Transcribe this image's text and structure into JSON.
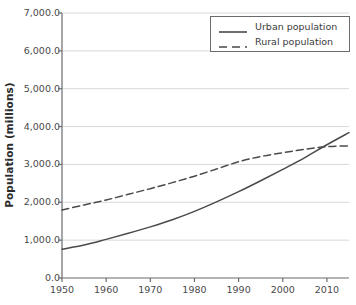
{
  "chart_data": {
    "type": "line",
    "title": "",
    "xlabel": "",
    "ylabel": "Population (millions)",
    "xlim": [
      1950,
      2015
    ],
    "ylim": [
      0,
      7000
    ],
    "grid": true,
    "legend_position": "top-right",
    "x_ticks": [
      1950,
      1960,
      1970,
      1980,
      1990,
      2000,
      2010
    ],
    "x_tick_labels": [
      "1950",
      "1960",
      "1970",
      "1980",
      "1990",
      "2000",
      "2010"
    ],
    "y_ticks": [
      0,
      1000,
      2000,
      3000,
      4000,
      5000,
      6000,
      7000
    ],
    "y_tick_labels": [
      "0.0",
      "1,000.0",
      "2,000.0",
      "3,000.0",
      "4,000.0",
      "5,000.0",
      "6,000.0",
      "7,000.0"
    ],
    "x": [
      1950,
      1955,
      1960,
      1965,
      1970,
      1975,
      1980,
      1985,
      1990,
      1995,
      2000,
      2005,
      2010,
      2015
    ],
    "series": [
      {
        "name": "Urban population",
        "style": "solid",
        "color": "#4a4a4a",
        "values": [
          760,
          870,
          1020,
          1180,
          1350,
          1540,
          1760,
          2010,
          2280,
          2570,
          2870,
          3180,
          3520,
          3840
        ]
      },
      {
        "name": "Rural population",
        "style": "dashed",
        "color": "#4a4a4a",
        "values": [
          1795,
          1930,
          2060,
          2210,
          2360,
          2520,
          2690,
          2880,
          3070,
          3210,
          3310,
          3400,
          3470,
          3490
        ]
      }
    ],
    "annotations": [
      "Urban and rural curves cross near 2008 at about 3,450 million"
    ]
  },
  "legend": {
    "entries": [
      {
        "label": "Urban population"
      },
      {
        "label": "Rural population"
      }
    ]
  },
  "axis": {
    "y_title": "Population (millions)"
  },
  "colors": {
    "line": "#4a4a4a",
    "grid": "#d8d8d8",
    "axis": "#6b6b6b",
    "text": "#3a3a3a",
    "background": "#ffffff"
  }
}
